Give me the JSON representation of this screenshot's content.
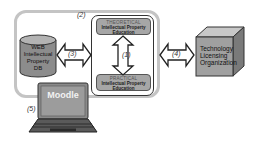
{
  "diagram": {
    "labels": {
      "outer_frame": "(2)",
      "vertical_arrow": "(1)",
      "db_arrow": "(3)",
      "tlo_arrow": "(4)",
      "moodle": "(5)"
    },
    "database": {
      "lines": [
        "WEB",
        "Intellectual",
        "Property",
        "DB"
      ]
    },
    "theoretical_box": {
      "header": "THEORETICAL",
      "line1": "Intellectual Property",
      "line2": "Education"
    },
    "practical_box": {
      "header": "PRACTICAL",
      "line1": "Intellectual Property",
      "line2": "Education"
    },
    "tlo": {
      "lines": [
        "Technology",
        "Licensing",
        "Organization"
      ]
    },
    "laptop": {
      "screen_text": "Moodle"
    },
    "colors": {
      "box_fill": "#a6a6a6",
      "db_fill": "#8c8c8c",
      "cube_front": "#a0a0a0",
      "cube_top": "#c8c8c8",
      "cube_side": "#7a7a7a",
      "outer_border": "#c4c4c4"
    }
  }
}
